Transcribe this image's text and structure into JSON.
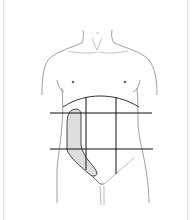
{
  "figure": {
    "grid": {
      "horizontal_lines": 2,
      "vertical_lines": 2,
      "regions": 9
    },
    "highlight": {
      "label": "shaded area",
      "region": "right flank / lateral abdomen",
      "fill": "#d9d9d9"
    },
    "colors": {
      "outline": "#555555",
      "grid": "#111111",
      "background": "#ffffff"
    }
  }
}
